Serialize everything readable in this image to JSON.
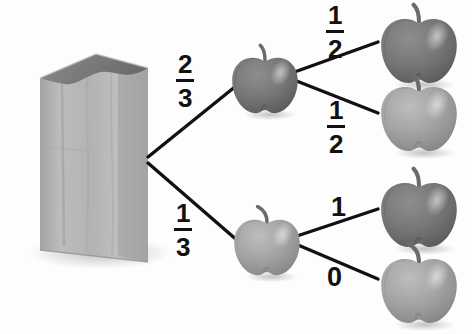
{
  "diagram": {
    "background_color": "#fdfdfd",
    "line_color": "#111111",
    "text_color": "#111111"
  },
  "root": {
    "name": "paper-bag",
    "label": "paper bag of apples",
    "bag_body_color": "#b5b5b5",
    "bag_shade_color": "#9a9a9a",
    "bag_opening_color": "#6e6e6e"
  },
  "branches": {
    "level1": [
      {
        "id": "b1",
        "probability": "2/3",
        "numerator": "2",
        "denominator": "3",
        "outcome": "red-apple"
      },
      {
        "id": "b2",
        "probability": "1/3",
        "numerator": "1",
        "denominator": "3",
        "outcome": "green-apple"
      }
    ],
    "level2": [
      {
        "id": "b1a",
        "probability": "1/2",
        "numerator": "1",
        "denominator": "2",
        "outcome": "red-apple"
      },
      {
        "id": "b1b",
        "probability": "1/2",
        "numerator": "1",
        "denominator": "2",
        "outcome": "green-apple"
      },
      {
        "id": "b2a",
        "probability": "1",
        "whole": "1",
        "outcome": "red-apple"
      },
      {
        "id": "b2b",
        "probability": "0",
        "whole": "0",
        "outcome": "green-apple"
      }
    ]
  },
  "nodes": {
    "apple_red_color": "#7d7d7d",
    "apple_red_dark": "#5f5f5f",
    "apple_green_color": "#a6a6a6",
    "apple_green_dark": "#8b8b8b",
    "apple_stem_color": "#6b6b6b",
    "shadow_color": "#cfcfcf",
    "items": [
      {
        "id": "n1",
        "name": "apple-node-red-level1",
        "kind": "red-apple",
        "alt": "dark red apple"
      },
      {
        "id": "n2",
        "name": "apple-node-green-level1",
        "kind": "green-apple",
        "alt": "light green apple"
      },
      {
        "id": "n3",
        "name": "apple-node-red-top",
        "kind": "red-apple",
        "alt": "dark red apple"
      },
      {
        "id": "n4",
        "name": "apple-node-green-upper",
        "kind": "green-apple",
        "alt": "light green apple"
      },
      {
        "id": "n5",
        "name": "apple-node-red-lower",
        "kind": "red-apple",
        "alt": "dark red apple"
      },
      {
        "id": "n6",
        "name": "apple-node-green-bottom",
        "kind": "green-apple",
        "alt": "light green apple"
      }
    ]
  }
}
